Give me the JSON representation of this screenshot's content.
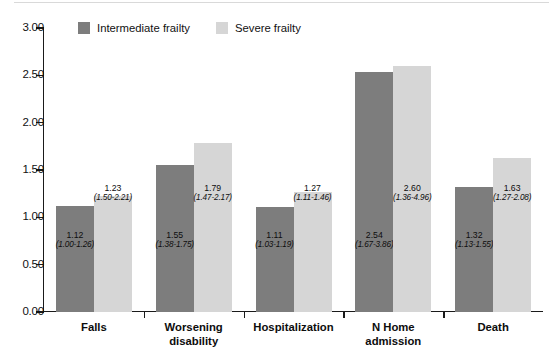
{
  "chart_data": {
    "type": "bar",
    "title": "",
    "subtitle": "",
    "xlabel": "",
    "ylabel": "",
    "ylim": [
      0.0,
      3.0
    ],
    "y_ticks": [
      "0.00",
      "0.50",
      "1.00",
      "1.50",
      "2.00",
      "2.50",
      "3.00"
    ],
    "y_tick_values": [
      0.0,
      0.5,
      1.0,
      1.5,
      2.0,
      2.5,
      3.0
    ],
    "grid": false,
    "legend_position": "top-left-inside",
    "categories": [
      "Falls",
      "Worsening disability",
      "Hospitalization",
      "N Home admission",
      "Death"
    ],
    "category_label_lines": [
      [
        "Falls"
      ],
      [
        "Worsening",
        "disability"
      ],
      [
        "Hospitalization"
      ],
      [
        "N Home",
        "admission"
      ],
      [
        "Death"
      ]
    ],
    "series": [
      {
        "name": "Intermediate frailty",
        "color": "#7d7d7d",
        "values": [
          1.12,
          1.55,
          1.11,
          2.54,
          1.32
        ],
        "value_labels": [
          "1.12",
          "1.55",
          "1.11",
          "2.54",
          "1.32"
        ],
        "ci_labels": [
          "(1.00-1.26)",
          "(1.38-1.75)",
          "(1.03-1.19)",
          "(1.67-3.86)",
          "(1.13-1.55)"
        ],
        "ci_low": [
          1.0,
          1.38,
          1.03,
          1.67,
          1.13
        ],
        "ci_high": [
          1.26,
          1.75,
          1.19,
          3.86,
          1.55
        ]
      },
      {
        "name": "Severe frailty",
        "color": "#d6d6d6",
        "values": [
          1.23,
          1.79,
          1.27,
          2.6,
          1.63
        ],
        "value_labels": [
          "1.23",
          "1.79",
          "1.27",
          "2.60",
          "1.63"
        ],
        "ci_labels": [
          "(1.50-2.21)",
          "(1.47-2.17)",
          "(1.11-1.46)",
          "(1.36-4.96)",
          "(1.27-2.08)"
        ],
        "ci_low": [
          1.5,
          1.47,
          1.11,
          1.36,
          1.27
        ],
        "ci_high": [
          2.21,
          2.17,
          1.46,
          4.96,
          2.08
        ]
      }
    ]
  },
  "legend": {
    "entries": [
      {
        "label": "Intermediate frailty",
        "swatch": "intermediate"
      },
      {
        "label": "Severe frailty",
        "swatch": "severe"
      }
    ]
  }
}
